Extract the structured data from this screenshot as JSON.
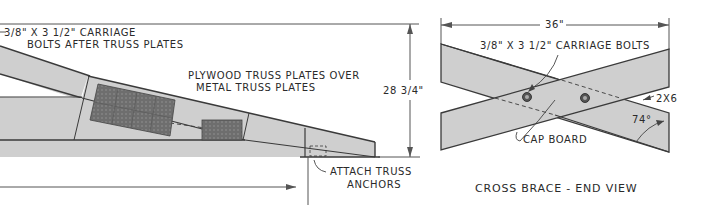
{
  "left_view": {
    "labels": {
      "carriage_bolts_line1": "3/8\" X 3 1/2\" CARRIAGE",
      "carriage_bolts_line2": "BOLTS AFTER TRUSS PLATES",
      "plywood_line1": "PLYWOOD TRUSS PLATES OVER",
      "plywood_line2": "METAL TRUSS PLATES",
      "height_dimension": "28 3/4\"",
      "anchors_line1": "ATTACH TRUSS",
      "anchors_line2": "ANCHORS"
    }
  },
  "right_view": {
    "title": "CROSS BRACE - END VIEW",
    "labels": {
      "width_dimension": "36\"",
      "carriage_bolts": "3/8\" X 3 1/2\" CARRIAGE BOLTS",
      "lumber_size": "2X6",
      "angle": "74°",
      "cap_board": "CAP BOARD"
    }
  },
  "colors": {
    "lumber_fill": "#cfcfcf",
    "plate_fill": "#6e6e6e",
    "line": "#3a3a3a"
  }
}
